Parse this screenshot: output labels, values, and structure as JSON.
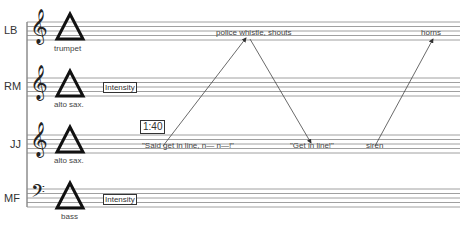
{
  "staves": [
    {
      "player": "LB",
      "clef": "treble",
      "instrument": "trumpet",
      "top": 22
    },
    {
      "player": "RM",
      "clef": "treble",
      "instrument": "alto sax.",
      "top": 78,
      "box": "Intensity"
    },
    {
      "player": "JJ",
      "clef": "treble",
      "instrument": "alto sax.",
      "top": 135
    },
    {
      "player": "MF",
      "clef": "bass",
      "instrument": "bass",
      "top": 189,
      "box": "Intensity"
    }
  ],
  "time_marker": "1:40",
  "cues": {
    "police": "police whistle, shouts",
    "horns": "horns",
    "said": "\"Said get in line, n— n—!\"",
    "getinline": "\"Get in line!\"",
    "siren": "siren"
  },
  "colors": {
    "line": "#555555",
    "staff": "#888888",
    "text": "#333333"
  }
}
